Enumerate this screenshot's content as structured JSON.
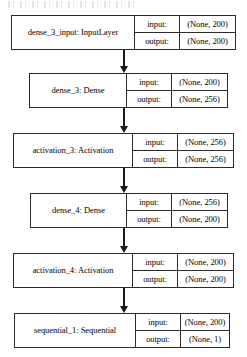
{
  "diagram": {
    "type": "neural-network-layer-graph",
    "orientation": "top-to-bottom",
    "io_labels": {
      "input": "input:",
      "output": "output:"
    },
    "artifact": {
      "name": "scan-smudge",
      "description": "faint illegible scan artifact along top edge"
    },
    "colors": {
      "border": "#2b2b2b",
      "arrow": "#1a1a1a",
      "background": "#ffffff",
      "text": "#000000"
    },
    "nodes": [
      {
        "id": "dense_3_input",
        "name": "dense_3_input: InputLayer",
        "input": "(None, 200)",
        "output": "(None, 200)",
        "box": {
          "left": 11,
          "top": 15,
          "width": 225,
          "height": 35
        },
        "name_width": 122,
        "label_width": 45
      },
      {
        "id": "dense_3",
        "name": "dense_3: Dense",
        "input": "(None, 200)",
        "output": "(None, 256)",
        "box": {
          "left": 29,
          "top": 73,
          "width": 199,
          "height": 35
        },
        "name_width": 96,
        "label_width": 45
      },
      {
        "id": "activation_3",
        "name": "activation_3: Activation",
        "input": "(None, 256)",
        "output": "(None, 256)",
        "box": {
          "left": 13,
          "top": 133,
          "width": 221,
          "height": 35
        },
        "name_width": 118,
        "label_width": 45
      },
      {
        "id": "dense_4",
        "name": "dense_4: Dense",
        "input": "(None, 256)",
        "output": "(None, 200)",
        "box": {
          "left": 30,
          "top": 193,
          "width": 198,
          "height": 35
        },
        "name_width": 95,
        "label_width": 45
      },
      {
        "id": "activation_4",
        "name": "activation_4: Activation",
        "input": "(None, 200)",
        "output": "(None, 200)",
        "box": {
          "left": 13,
          "top": 253,
          "width": 221,
          "height": 35
        },
        "name_width": 118,
        "label_width": 45
      },
      {
        "id": "sequential_1",
        "name": "sequential_1: Sequential",
        "input": "(None, 200)",
        "output": "(None, 1)",
        "box": {
          "left": 14,
          "top": 313,
          "width": 216,
          "height": 35
        },
        "name_width": 120,
        "label_width": 45
      }
    ],
    "edges": [
      {
        "from": "dense_3_input",
        "to": "dense_3",
        "x": 123,
        "top": 50,
        "height": 23
      },
      {
        "from": "dense_3",
        "to": "activation_3",
        "x": 123,
        "top": 108,
        "height": 25
      },
      {
        "from": "activation_3",
        "to": "dense_4",
        "x": 123,
        "top": 168,
        "height": 25
      },
      {
        "from": "dense_4",
        "to": "activation_4",
        "x": 123,
        "top": 228,
        "height": 25
      },
      {
        "from": "activation_4",
        "to": "sequential_1",
        "x": 123,
        "top": 288,
        "height": 25
      }
    ]
  }
}
